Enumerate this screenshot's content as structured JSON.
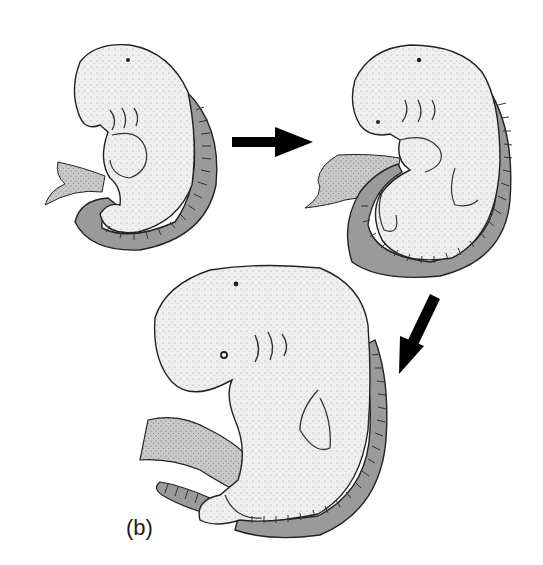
{
  "figure": {
    "panel_label": "(b)",
    "stages": [
      {
        "name": "early-embryo",
        "position": "top-left"
      },
      {
        "name": "middle-embryo",
        "position": "top-right"
      },
      {
        "name": "late-embryo",
        "position": "bottom-center"
      }
    ],
    "arrows": [
      {
        "name": "arrow-right",
        "from": "early-embryo",
        "to": "middle-embryo"
      },
      {
        "name": "arrow-down-left",
        "from": "middle-embryo",
        "to": "late-embryo"
      }
    ],
    "colors": {
      "body_fill": "#ececec",
      "somite_band": "#9a9a9a",
      "outline": "#1a1a1a",
      "arrow": "#000000",
      "background": "#ffffff"
    }
  }
}
